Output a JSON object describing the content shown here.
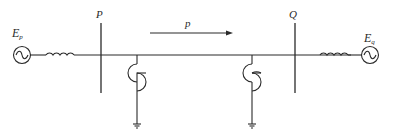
{
  "diagram": {
    "type": "power-system single-line diagram",
    "labels": {
      "source_left": "E",
      "source_left_sub": "p",
      "source_right": "E",
      "source_right_sub": "q",
      "bus_left": "P",
      "bus_right": "Q",
      "power_flow": "p"
    },
    "components": [
      {
        "id": "gen-left",
        "kind": "ac-source",
        "label": "Ep"
      },
      {
        "id": "reactor-left",
        "kind": "inductor"
      },
      {
        "id": "bus-P",
        "kind": "bus",
        "label": "P"
      },
      {
        "id": "comp-left",
        "kind": "shunt-compensator-grounded"
      },
      {
        "id": "comp-right",
        "kind": "shunt-compensator-grounded"
      },
      {
        "id": "bus-Q",
        "kind": "bus",
        "label": "Q"
      },
      {
        "id": "reactor-right",
        "kind": "inductor"
      },
      {
        "id": "gen-right",
        "kind": "ac-source",
        "label": "Eq"
      }
    ],
    "flow_direction": "P to Q",
    "colors": {
      "line": "#2a2a2a",
      "background": "#ffffff"
    }
  }
}
